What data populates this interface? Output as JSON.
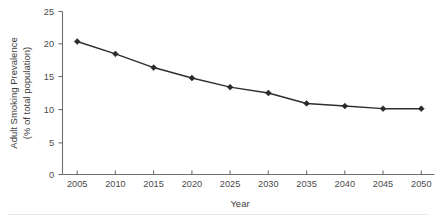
{
  "chart_data": {
    "type": "line",
    "title": "",
    "xlabel": "Year",
    "ylabel": "Adult Smoking Prevalence (% of total population)",
    "ylabel_line1": "Adult Smoking Prevalence",
    "ylabel_line2": "(% of total population)",
    "categories": [
      2005,
      2010,
      2015,
      2020,
      2025,
      2030,
      2035,
      2040,
      2045,
      2050
    ],
    "x_tick_labels": [
      "2005",
      "2010",
      "2015",
      "2020",
      "2025",
      "2030",
      "2035",
      "2040",
      "2045",
      "2050"
    ],
    "values": [
      20.4,
      18.5,
      16.4,
      14.8,
      13.4,
      12.5,
      10.9,
      10.5,
      10.1,
      10.1
    ],
    "y_tick_labels": [
      "0",
      "5",
      "10",
      "15",
      "20",
      "25"
    ],
    "y_ticks": [
      0,
      5,
      10,
      15,
      20,
      25
    ],
    "ylim": [
      0,
      25
    ],
    "xlim": [
      2005,
      2050
    ],
    "grid": false,
    "legend": false,
    "legend_position": "none",
    "marker": "diamond",
    "series_color": "#2a2a2a",
    "axis_color": "#6f6f6f"
  },
  "figure": {
    "background_color": "#ffffff"
  }
}
